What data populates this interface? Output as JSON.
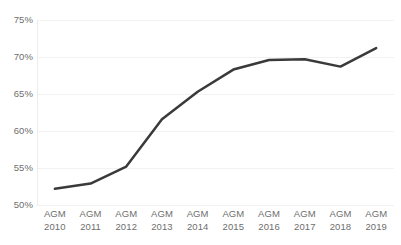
{
  "chart_data": {
    "type": "line",
    "title": "",
    "subtitle": "",
    "xlabel": "",
    "ylabel": "",
    "categories": [
      "AGM\n2010",
      "AGM\n2011",
      "AGM\n2012",
      "AGM\n2013",
      "AGM\n2014",
      "AGM\n2015",
      "AGM\n2016",
      "AGM\n2017",
      "AGM\n2018",
      "AGM\n2019"
    ],
    "category_lines": [
      {
        "l1": "AGM",
        "l2": "2010"
      },
      {
        "l1": "AGM",
        "l2": "2011"
      },
      {
        "l1": "AGM",
        "l2": "2012"
      },
      {
        "l1": "AGM",
        "l2": "2013"
      },
      {
        "l1": "AGM",
        "l2": "2014"
      },
      {
        "l1": "AGM",
        "l2": "2015"
      },
      {
        "l1": "AGM",
        "l2": "2016"
      },
      {
        "l1": "AGM",
        "l2": "2017"
      },
      {
        "l1": "AGM",
        "l2": "2018"
      },
      {
        "l1": "AGM",
        "l2": "2019"
      }
    ],
    "values": [
      52.2,
      52.9,
      55.2,
      61.6,
      65.3,
      68.3,
      69.6,
      69.7,
      68.7,
      71.2
    ],
    "value_labels": [
      "52.2%",
      "52.9%",
      "55.2%",
      "61.6%",
      "65.3%",
      "68.3%",
      "69.6%",
      "69.7%",
      "68.7%",
      "71.2%"
    ],
    "ylim": [
      50,
      75
    ],
    "ytick_values": [
      75,
      70,
      65,
      60,
      55,
      50
    ],
    "ytick_labels": [
      "75%",
      "70%",
      "65%",
      "60%",
      "55%",
      "50%"
    ],
    "grid": true,
    "grid_axis": "y",
    "legend": false,
    "legend_position": "none",
    "markers": false,
    "series": [
      {
        "name": "",
        "values": [
          52.2,
          52.9,
          55.2,
          61.6,
          65.3,
          68.3,
          69.6,
          69.7,
          68.7,
          71.2
        ]
      }
    ],
    "colors": {
      "line": "#3a3a3a",
      "grid": "#f2f2f2",
      "axis": "#ededed",
      "tick_label": "#6e6e6e",
      "background": "#ffffff"
    },
    "line_width": 2.5
  }
}
